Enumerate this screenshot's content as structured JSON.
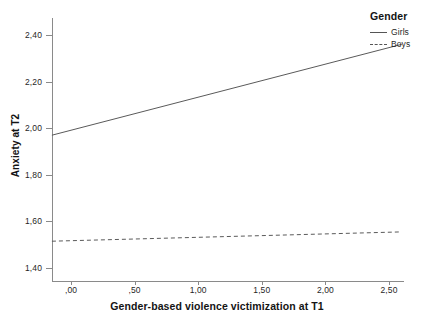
{
  "chart_data": {
    "type": "line",
    "title": "",
    "xlabel": "Gender-based violence victimization at T1",
    "ylabel": "Anxiety at T2",
    "xlim": [
      -0.15,
      2.62
    ],
    "ylim": [
      1.4,
      2.44
    ],
    "xticks": [
      0.0,
      0.5,
      1.0,
      1.5,
      2.0,
      2.5
    ],
    "xtick_labels": [
      ",00",
      ",50",
      "1,00",
      "1,50",
      "2,00",
      "2,50"
    ],
    "yticks": [
      1.4,
      1.6,
      1.8,
      2.0,
      2.2,
      2.4
    ],
    "ytick_labels": [
      "1,40",
      "1,60",
      "1,80",
      "2,00",
      "2,20",
      "2,40"
    ],
    "grid": false,
    "legend": {
      "title": "Gender",
      "position": "top-right",
      "entries": [
        {
          "label": "Girls",
          "style": "solid"
        },
        {
          "label": "Boys",
          "style": "dashed"
        }
      ]
    },
    "series": [
      {
        "name": "Girls",
        "style": "solid",
        "x": [
          -0.15,
          2.6
        ],
        "y": [
          1.97,
          2.36
        ]
      },
      {
        "name": "Boys",
        "style": "dashed",
        "x": [
          -0.15,
          2.6
        ],
        "y": [
          1.515,
          1.555
        ]
      }
    ],
    "colors": {
      "line": "#5a5a5a",
      "axis": "#8a8a8a",
      "text": "#1f1f1f",
      "background": "#ffffff"
    }
  }
}
